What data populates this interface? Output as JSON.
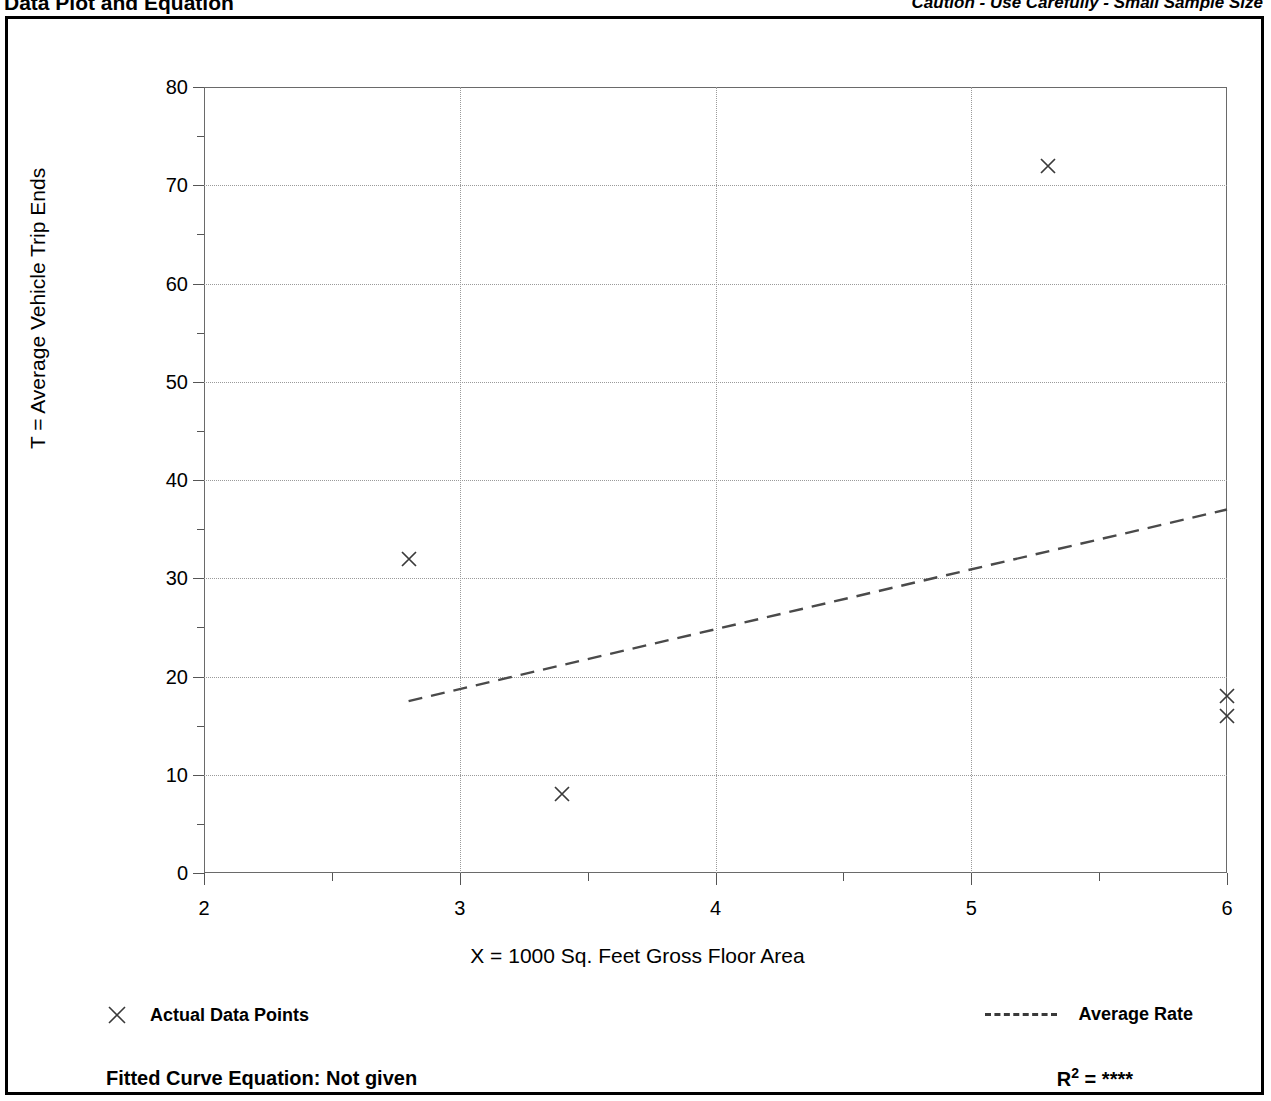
{
  "header": {
    "title": "Data Plot and Equation",
    "caution": "Caution - Use Carefully - Small Sample Size"
  },
  "legend": {
    "points_label": "Actual Data Points",
    "rate_label": "Average Rate",
    "point_marker": "x-marker-icon",
    "rate_marker": "dashed-line-icon"
  },
  "footer": {
    "equation_label": "Fitted Curve Equation:  Not given",
    "r2_symbol": "R",
    "r2_exponent": "2",
    "r2_equals": " = ",
    "r2_value": "****"
  },
  "chart_data": {
    "type": "scatter",
    "title": "Data Plot and Equation",
    "xlabel": "X = 1000 Sq. Feet Gross Floor Area",
    "ylabel": "T = Average Vehicle Trip Ends",
    "xlim": [
      2,
      6
    ],
    "ylim": [
      0,
      80
    ],
    "xticks": [
      2,
      3,
      4,
      5,
      6
    ],
    "yticks": [
      0,
      10,
      20,
      30,
      40,
      50,
      60,
      70,
      80
    ],
    "xtick_labels": [
      "2",
      "3",
      "4",
      "5",
      "6"
    ],
    "ytick_labels": [
      "0",
      "10",
      "20",
      "30",
      "40",
      "50",
      "60",
      "70",
      "80"
    ],
    "x_minor_step": 0.5,
    "y_minor_step": 5,
    "grid": true,
    "grid_style": "dotted",
    "legend_position": "below-plot",
    "series": [
      {
        "name": "Actual Data Points",
        "type": "scatter",
        "marker": "x",
        "points": [
          {
            "x": 2.8,
            "y": 32
          },
          {
            "x": 3.4,
            "y": 8
          },
          {
            "x": 5.3,
            "y": 72
          },
          {
            "x": 6.0,
            "y": 18
          },
          {
            "x": 6.0,
            "y": 16
          }
        ]
      },
      {
        "name": "Average Rate",
        "type": "line",
        "style": "dashed",
        "points": [
          {
            "x": 2.8,
            "y": 17.5
          },
          {
            "x": 6.0,
            "y": 37.0
          }
        ]
      }
    ]
  }
}
